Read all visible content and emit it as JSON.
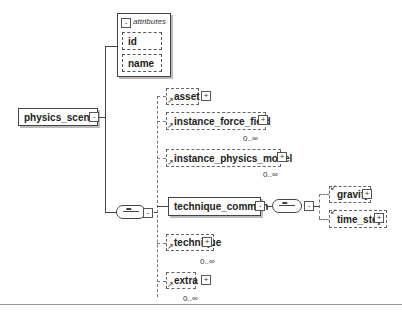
{
  "diagram": {
    "root": {
      "label": "physics_scene",
      "toggle": "-"
    },
    "attributes": {
      "title": "attributes",
      "toggle": "-",
      "items": [
        {
          "label": "id"
        },
        {
          "label": "name"
        }
      ]
    },
    "sequence": {
      "icon": "sequence-compositor",
      "toggle": "-"
    },
    "children": [
      {
        "label": "asset",
        "toggle": "+",
        "occurrence": ""
      },
      {
        "label": "instance_force_field",
        "toggle": "+",
        "occurrence": "0..∞"
      },
      {
        "label": "instance_physics_model",
        "toggle": "+",
        "occurrence": "0..∞"
      },
      {
        "label": "technique_common",
        "toggle": "-",
        "occurrence": ""
      },
      {
        "label": "technique",
        "toggle": "+",
        "occurrence": "0..∞"
      },
      {
        "label": "extra",
        "toggle": "+",
        "occurrence": "0..∞"
      }
    ],
    "technique_common_sequence": {
      "icon": "sequence-compositor",
      "toggle": "-"
    },
    "technique_common_children": [
      {
        "label": "gravity",
        "toggle": "+"
      },
      {
        "label": "time_step",
        "toggle": "+"
      }
    ]
  }
}
